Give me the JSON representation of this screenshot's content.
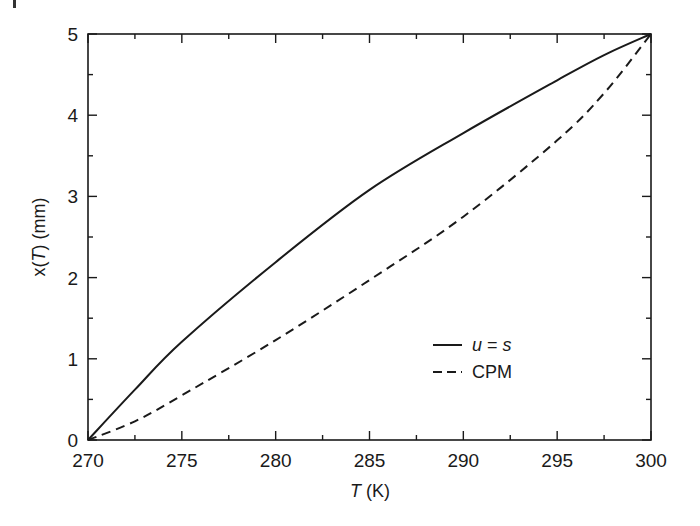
{
  "chart_data": {
    "type": "line",
    "title": "",
    "xlabel": "T (K)",
    "xlabel_parts": {
      "var": "T",
      "unit": " (K)"
    },
    "ylabel": "x(T) (mm)",
    "ylabel_parts": {
      "pre": "x(",
      "var": "T",
      "post": ") (mm)"
    },
    "xlim": [
      270,
      300
    ],
    "ylim": [
      0,
      5
    ],
    "xticks": [
      270,
      275,
      280,
      285,
      290,
      295,
      300
    ],
    "yticks": [
      0,
      1,
      2,
      3,
      4,
      5
    ],
    "x_minor_step": 2.5,
    "y_minor_step": 0.5,
    "grid": false,
    "legend_position": "lower right (inside)",
    "x": [
      270,
      272.5,
      275,
      280,
      285,
      290,
      295,
      297.5,
      300
    ],
    "series": [
      {
        "name": "u = s",
        "label_parts": {
          "a": "u",
          "op": " = ",
          "b": "s"
        },
        "style": "solid",
        "color": "#1a1a1a",
        "values": [
          0,
          0.62,
          1.21,
          2.19,
          3.08,
          3.78,
          4.43,
          4.74,
          5.0
        ]
      },
      {
        "name": "CPM",
        "style": "dashed",
        "color": "#1a1a1a",
        "values": [
          0,
          0.23,
          0.55,
          1.23,
          1.97,
          2.75,
          3.69,
          4.27,
          5.0
        ]
      }
    ]
  }
}
